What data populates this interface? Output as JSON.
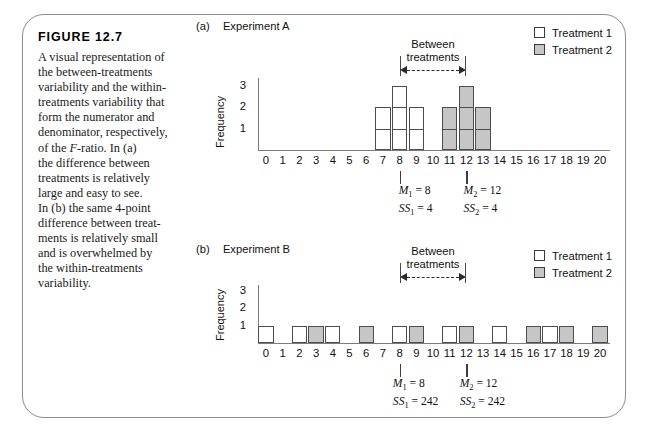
{
  "figure": {
    "number_label": "FIGURE 12.7",
    "caption_lines": [
      "A visual representation of",
      "the between-treatments",
      "variability and the within-",
      "treatments variability that",
      "form the numerator and",
      "denominator, respectively,",
      "of the F-ratio. In (a)",
      "the difference between",
      "treatments is relatively",
      "large and easy to see.",
      "In (b) the same 4-point",
      "difference between treat-",
      "ments is relatively small",
      "and is overwhelmed by",
      "the within-treatments",
      "variability."
    ]
  },
  "legend": {
    "items": [
      {
        "label": "Treatment 1",
        "fill": "white",
        "color": "#ffffff"
      },
      {
        "label": "Treatment 2",
        "fill": "gray",
        "color": "#c6c6c6"
      }
    ]
  },
  "annotation": {
    "between_line1": "Between",
    "between_line2": "treatments"
  },
  "axis": {
    "y_title": "Frequency",
    "y_ticks": [
      "3",
      "2",
      "1"
    ],
    "x_ticks": [
      "0",
      "1",
      "2",
      "3",
      "4",
      "5",
      "6",
      "7",
      "8",
      "9",
      "10",
      "11",
      "12",
      "13",
      "14",
      "15",
      "16",
      "17",
      "18",
      "19",
      "20"
    ]
  },
  "panels": [
    {
      "id": "a",
      "marker": "(a)",
      "title": "Experiment A",
      "stats": [
        {
          "mean_symbol": "M",
          "mean_sub": "1",
          "mean_value": "8",
          "ss_symbol": "SS",
          "ss_sub": "1",
          "ss_value": "4",
          "mean_text": "M1 = 8",
          "ss_text": "SS1 = 4",
          "x": 8
        },
        {
          "mean_symbol": "M",
          "mean_sub": "2",
          "mean_value": "12",
          "ss_symbol": "SS",
          "ss_sub": "2",
          "ss_value": "4",
          "mean_text": "M2 = 12",
          "ss_text": "SS2 = 4",
          "x": 12
        }
      ]
    },
    {
      "id": "b",
      "marker": "(b)",
      "title": "Experiment B",
      "stats": [
        {
          "mean_symbol": "M",
          "mean_sub": "1",
          "mean_value": "8",
          "ss_symbol": "SS",
          "ss_sub": "1",
          "ss_value": "242",
          "mean_text": "M1 = 8",
          "ss_text": "SS1 = 242",
          "x": 8
        },
        {
          "mean_symbol": "M",
          "mean_sub": "2",
          "mean_value": "12",
          "ss_symbol": "SS",
          "ss_sub": "2",
          "ss_value": "242",
          "mean_text": "M2 = 12",
          "ss_text": "SS2 = 242",
          "x": 12
        }
      ]
    }
  ],
  "chart_data": [
    {
      "type": "bar",
      "title": "Experiment A",
      "xlabel": "",
      "ylabel": "Frequency",
      "xlim": [
        0,
        20
      ],
      "ylim": [
        0,
        3
      ],
      "grid": false,
      "legend_position": "top-right",
      "x": [
        0,
        1,
        2,
        3,
        4,
        5,
        6,
        7,
        8,
        9,
        10,
        11,
        12,
        13,
        14,
        15,
        16,
        17,
        18,
        19,
        20
      ],
      "series": [
        {
          "name": "Treatment 1",
          "color": "#ffffff",
          "values": [
            0,
            0,
            0,
            0,
            0,
            0,
            0,
            2,
            3,
            2,
            0,
            0,
            0,
            0,
            0,
            0,
            0,
            0,
            0,
            0,
            0
          ]
        },
        {
          "name": "Treatment 2",
          "color": "#c6c6c6",
          "values": [
            0,
            0,
            0,
            0,
            0,
            0,
            0,
            0,
            0,
            0,
            0,
            2,
            3,
            2,
            0,
            0,
            0,
            0,
            0,
            0,
            0
          ]
        }
      ],
      "annotations": [
        {
          "text": "Between treatments",
          "from_x": 8,
          "to_x": 12,
          "style": "dashed-double-arrow"
        },
        {
          "text": "M1 = 8",
          "at_x": 8
        },
        {
          "text": "SS1 = 4",
          "at_x": 8
        },
        {
          "text": "M2 = 12",
          "at_x": 12
        },
        {
          "text": "SS2 = 4",
          "at_x": 12
        }
      ]
    },
    {
      "type": "bar",
      "title": "Experiment B",
      "xlabel": "",
      "ylabel": "Frequency",
      "xlim": [
        0,
        20
      ],
      "ylim": [
        0,
        3
      ],
      "grid": false,
      "legend_position": "top-right",
      "x": [
        0,
        1,
        2,
        3,
        4,
        5,
        6,
        7,
        8,
        9,
        10,
        11,
        12,
        13,
        14,
        15,
        16,
        17,
        18,
        19,
        20
      ],
      "series": [
        {
          "name": "Treatment 1",
          "color": "#ffffff",
          "values": [
            1,
            0,
            1,
            0,
            1,
            0,
            0,
            0,
            1,
            0,
            0,
            1,
            0,
            0,
            1,
            0,
            0,
            1,
            0,
            0,
            0
          ]
        },
        {
          "name": "Treatment 2",
          "color": "#c6c6c6",
          "values": [
            0,
            0,
            0,
            1,
            0,
            0,
            1,
            0,
            0,
            1,
            0,
            0,
            1,
            0,
            0,
            0,
            1,
            0,
            1,
            0,
            1
          ]
        }
      ],
      "annotations": [
        {
          "text": "Between treatments",
          "from_x": 8,
          "to_x": 12,
          "style": "dashed-double-arrow"
        },
        {
          "text": "M1 = 8",
          "at_x": 8
        },
        {
          "text": "SS1 = 242",
          "at_x": 8
        },
        {
          "text": "M2 = 12",
          "at_x": 12
        },
        {
          "text": "SS2 = 242",
          "at_x": 12
        }
      ]
    }
  ]
}
